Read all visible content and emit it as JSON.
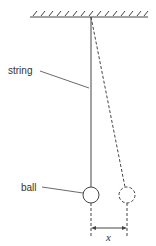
{
  "diagram": {
    "type": "pendulum",
    "labels": {
      "string": "string",
      "ball": "ball",
      "displacement": "x"
    },
    "colors": {
      "stroke": "#444444",
      "background": "#ffffff"
    }
  }
}
